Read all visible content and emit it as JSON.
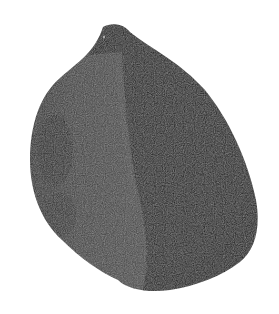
{
  "image": {
    "subject": "dark seed / stone",
    "background": "#ffffff",
    "colors": {
      "shadow_side": "#151515",
      "lit_side": "#3a3a3a",
      "highlight": "#555555",
      "edge": "#0e0e0e"
    }
  }
}
